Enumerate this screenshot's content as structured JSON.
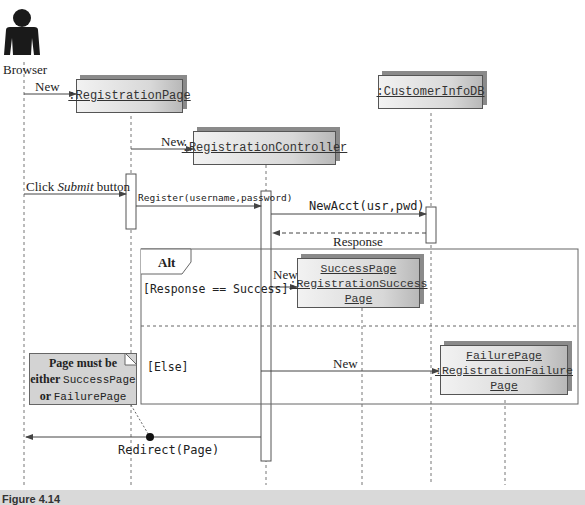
{
  "actor": {
    "label": "Browser"
  },
  "objects": {
    "registration_page": {
      "label": ":RegistrationPage"
    },
    "customer_db": {
      "label": ":CustomerInfoDB"
    },
    "controller": {
      "label": ":RegistrationController"
    },
    "success_page": {
      "line1": "SuccessPage",
      "line2": ":RegistrationSuccess",
      "line3": "Page"
    },
    "failure_page": {
      "line1": "FailurePage",
      "line2": ":RegistrationFailure",
      "line3": "Page"
    }
  },
  "messages": {
    "new_page": "New",
    "new_controller": "New",
    "click_submit_prefix": "Click ",
    "click_submit_em": "Submit",
    "click_submit_suffix": " button",
    "register": "Register(username,password)",
    "new_acct": "NewAcct(usr,pwd)",
    "response": "Response",
    "new_success": "New",
    "new_failure": "New",
    "redirect": "Redirect(Page)"
  },
  "fragment": {
    "operator": "Alt",
    "guard1": "[Response == Success]",
    "guard2": "[Else]"
  },
  "note": {
    "line1": "Page must be",
    "line2_bold": "either ",
    "line2_mono": "SuccessPage",
    "line3_bold": "or ",
    "line3_mono": "FailurePage"
  },
  "caption": {
    "text": "Figure 4.14"
  }
}
